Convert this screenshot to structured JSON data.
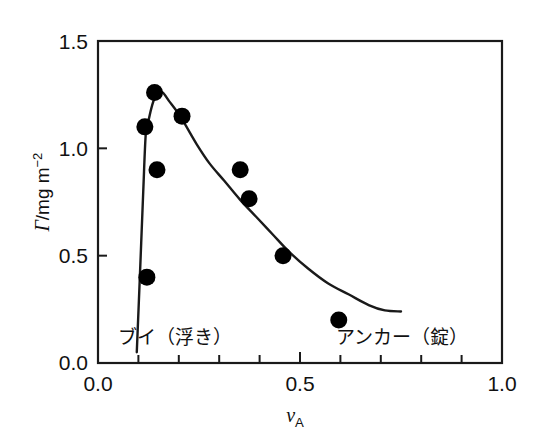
{
  "chart_data": {
    "type": "scatter",
    "title": "",
    "xlabel": "νA",
    "ylabel": "Γ/mg m−2",
    "xlim": [
      0.0,
      1.0
    ],
    "ylim": [
      0.0,
      1.5
    ],
    "grid": false,
    "legend_position": "none",
    "x_ticks_major": [
      "0.0",
      "0.5",
      "1.0"
    ],
    "x_ticks_major_values": [
      0.0,
      0.5,
      1.0
    ],
    "x_ticks_minor_values": [
      0.1,
      0.2,
      0.3,
      0.4,
      0.6,
      0.7,
      0.8,
      0.9
    ],
    "y_ticks_major": [
      "0.0",
      "0.5",
      "1.0",
      "1.5"
    ],
    "y_ticks_major_values": [
      0.0,
      0.5,
      1.0,
      1.5
    ],
    "marker_style": "filled-circle",
    "marker_color": "#000000",
    "line_color": "#1a1a1a",
    "points": [
      {
        "x": 0.116,
        "y": 1.1
      },
      {
        "x": 0.121,
        "y": 0.4
      },
      {
        "x": 0.14,
        "y": 1.26
      },
      {
        "x": 0.146,
        "y": 0.9
      },
      {
        "x": 0.208,
        "y": 1.15
      },
      {
        "x": 0.352,
        "y": 0.9
      },
      {
        "x": 0.374,
        "y": 0.765
      },
      {
        "x": 0.458,
        "y": 0.5
      },
      {
        "x": 0.596,
        "y": 0.2
      }
    ],
    "curve": [
      {
        "x": 0.096,
        "y": 0.05
      },
      {
        "x": 0.104,
        "y": 0.42
      },
      {
        "x": 0.112,
        "y": 0.8
      },
      {
        "x": 0.118,
        "y": 1.06
      },
      {
        "x": 0.124,
        "y": 1.12
      },
      {
        "x": 0.134,
        "y": 1.2
      },
      {
        "x": 0.146,
        "y": 1.26
      },
      {
        "x": 0.16,
        "y": 1.26
      },
      {
        "x": 0.176,
        "y": 1.22
      },
      {
        "x": 0.196,
        "y": 1.17
      },
      {
        "x": 0.216,
        "y": 1.11
      },
      {
        "x": 0.244,
        "y": 1.02
      },
      {
        "x": 0.276,
        "y": 0.93
      },
      {
        "x": 0.312,
        "y": 0.85
      },
      {
        "x": 0.352,
        "y": 0.76
      },
      {
        "x": 0.392,
        "y": 0.68
      },
      {
        "x": 0.432,
        "y": 0.6
      },
      {
        "x": 0.472,
        "y": 0.52
      },
      {
        "x": 0.52,
        "y": 0.44
      },
      {
        "x": 0.57,
        "y": 0.37
      },
      {
        "x": 0.62,
        "y": 0.32
      },
      {
        "x": 0.67,
        "y": 0.27
      },
      {
        "x": 0.71,
        "y": 0.245
      },
      {
        "x": 0.75,
        "y": 0.24
      }
    ],
    "annotations": [
      {
        "id": "buoy",
        "text": "ブイ（浮き）",
        "x": 0.1,
        "y": 0.19
      },
      {
        "id": "anchor",
        "text": "アンカー（錠）",
        "x": 0.59,
        "y": 0.19
      }
    ]
  },
  "axes": {
    "y_label_parts": {
      "symbol": "Γ",
      "unit": "/mg m",
      "exponent": "−2"
    },
    "x_label_parts": {
      "symbol": "ν",
      "subscript": "A"
    },
    "y_tick_0": "0.0",
    "y_tick_1": "0.5",
    "y_tick_2": "1.0",
    "y_tick_3": "1.5",
    "x_tick_0": "0.0",
    "x_tick_1": "0.5",
    "x_tick_2": "1.0"
  },
  "annotations": {
    "buoy": "ブイ（浮き）",
    "anchor": "アンカー（錠）"
  }
}
